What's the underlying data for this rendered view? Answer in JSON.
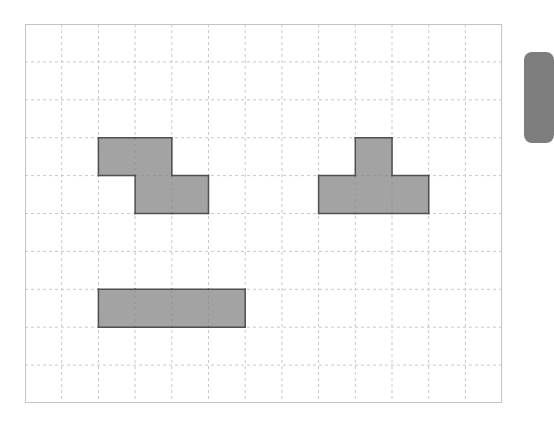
{
  "board": {
    "cols": 13,
    "rows": 10,
    "cell_w": 36.7,
    "cell_h": 37.9,
    "grid_color": "#c8c8c8",
    "border_color": "#c4c4c4",
    "piece_fill": "#a3a3a3",
    "piece_stroke": "#505050"
  },
  "pieces": [
    {
      "name": "z-piece",
      "cells": [
        [
          2,
          3
        ],
        [
          3,
          3
        ],
        [
          3,
          4
        ],
        [
          4,
          4
        ]
      ]
    },
    {
      "name": "t-piece",
      "cells": [
        [
          9,
          3
        ],
        [
          8,
          4
        ],
        [
          9,
          4
        ],
        [
          10,
          4
        ]
      ]
    },
    {
      "name": "i-piece",
      "cells": [
        [
          2,
          7
        ],
        [
          3,
          7
        ],
        [
          4,
          7
        ],
        [
          5,
          7
        ]
      ]
    }
  ],
  "side_panel": {
    "color": "#7d7d7d"
  }
}
